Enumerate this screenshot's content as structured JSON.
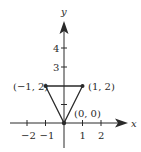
{
  "figure": {
    "axes": {
      "x_label": "x",
      "y_label": "y",
      "x_ticks": [
        {
          "value": -2,
          "label": "−2"
        },
        {
          "value": -1,
          "label": "−1"
        },
        {
          "value": 1,
          "label": "1"
        },
        {
          "value": 2,
          "label": "2"
        }
      ],
      "y_ticks": [
        {
          "value": 1,
          "label": ""
        },
        {
          "value": 3,
          "label": "3"
        },
        {
          "value": 4,
          "label": "4"
        }
      ]
    },
    "triangle": {
      "vertices": [
        {
          "x": -1,
          "y": 2,
          "label": "(−1, 2)"
        },
        {
          "x": 1,
          "y": 2,
          "label": "(1, 2)"
        },
        {
          "x": 0,
          "y": 0,
          "label": "(0, 0)"
        }
      ]
    },
    "colors": {
      "line": "#2a2a2a",
      "background": "#ffffff"
    }
  }
}
